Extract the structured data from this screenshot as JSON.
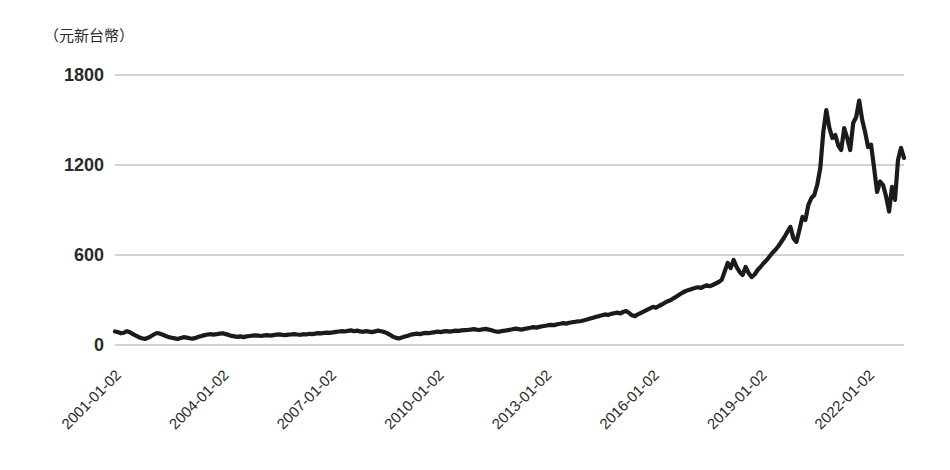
{
  "chart_data": {
    "type": "line",
    "title": "",
    "unit_label": "（元新台幣）",
    "xlabel": "",
    "ylabel": "（元新台幣）",
    "ylim": [
      0,
      1800
    ],
    "yticks": [
      0,
      600,
      1200,
      1800
    ],
    "xticks": [
      "2001-01-02",
      "2004-01-02",
      "2007-01-02",
      "2010-01-02",
      "2013-01-02",
      "2016-01-02",
      "2019-01-02",
      "2022-01-02"
    ],
    "xtick_interval_months": 36,
    "grid": "horizontal-only",
    "legend": "none",
    "series": [
      {
        "name": "share-price-twd",
        "x_start_month": "2001-01",
        "x_step_months": 1,
        "x_end_month": "2023-01",
        "sampling_note": "monthly values estimated from plotted daily trace",
        "values": [
          90,
          86,
          78,
          82,
          92,
          85,
          73,
          62,
          52,
          45,
          40,
          48,
          58,
          70,
          80,
          76,
          68,
          60,
          53,
          48,
          44,
          40,
          46,
          52,
          49,
          45,
          43,
          47,
          55,
          61,
          66,
          70,
          72,
          69,
          72,
          76,
          78,
          73,
          67,
          61,
          57,
          54,
          57,
          53,
          57,
          60,
          62,
          64,
          62,
          60,
          64,
          66,
          63,
          66,
          69,
          71,
          68,
          66,
          69,
          71,
          73,
          70,
          68,
          72,
          70,
          75,
          73,
          76,
          79,
          77,
          81,
          83,
          81,
          85,
          87,
          90,
          93,
          90,
          95,
          97,
          92,
          96,
          91,
          88,
          93,
          89,
          86,
          91,
          96,
          92,
          87,
          79,
          68,
          56,
          47,
          44,
          50,
          56,
          62,
          69,
          73,
          76,
          73,
          77,
          81,
          79,
          83,
          86,
          89,
          86,
          91,
          93,
          89,
          93,
          96,
          94,
          97,
          99,
          101,
          103,
          106,
          103,
          100,
          105,
          107,
          103,
          98,
          92,
          88,
          91,
          95,
          97,
          101,
          105,
          109,
          106,
          103,
          107,
          111,
          115,
          119,
          116,
          121,
          125,
          128,
          132,
          135,
          133,
          138,
          142,
          146,
          143,
          148,
          152,
          155,
          158,
          160,
          165,
          170,
          176,
          182,
          188,
          193,
          198,
          204,
          200,
          207,
          212,
          216,
          210,
          220,
          226,
          215,
          198,
          193,
          205,
          215,
          225,
          235,
          245,
          255,
          248,
          260,
          270,
          282,
          292,
          300,
          313,
          325,
          338,
          350,
          360,
          367,
          374,
          380,
          385,
          380,
          390,
          398,
          392,
          400,
          410,
          420,
          434,
          490,
          547,
          513,
          567,
          520,
          487,
          467,
          520,
          480,
          453,
          470,
          500,
          520,
          545,
          565,
          590,
          615,
          635,
          660,
          690,
          720,
          755,
          787,
          713,
          687,
          767,
          854,
          834,
          934,
          980,
          1000,
          1070,
          1180,
          1420,
          1567,
          1450,
          1380,
          1400,
          1330,
          1300,
          1447,
          1380,
          1300,
          1480,
          1520,
          1630,
          1500,
          1420,
          1320,
          1335,
          1180,
          1020,
          1090,
          1067,
          990,
          890,
          1054,
          967,
          1234,
          1314,
          1247
        ]
      }
    ],
    "colors": {
      "line": "#1b1b1b",
      "grid": "#a3a3a3",
      "tick_text": "#2a2a2a",
      "background": "#ffffff"
    }
  }
}
